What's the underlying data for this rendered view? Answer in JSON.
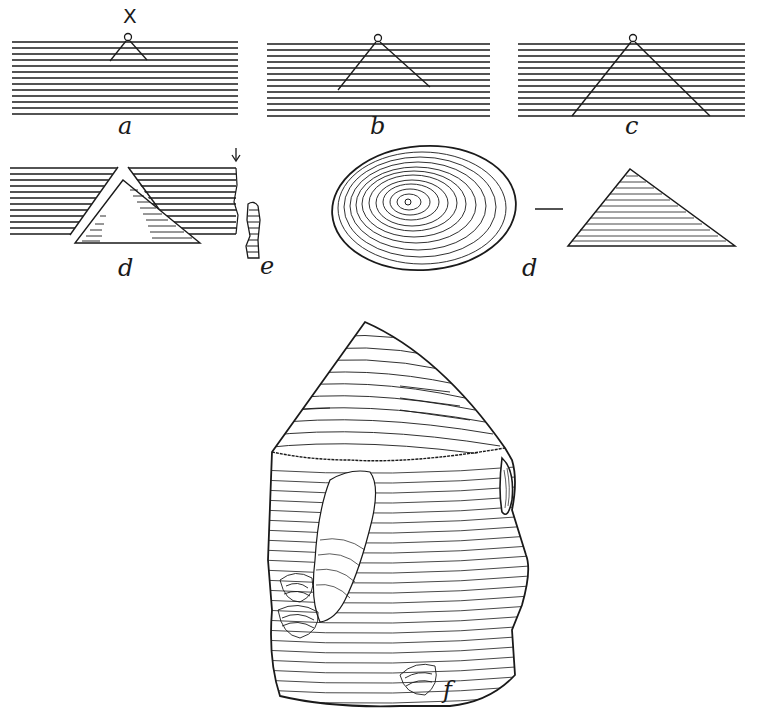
{
  "figure": {
    "ink_color": "#1a1a1a",
    "background": "#ffffff",
    "panels": [
      {
        "id": "a",
        "label": "a",
        "marker": "X",
        "cone_spread": "small"
      },
      {
        "id": "b",
        "label": "b",
        "cone_spread": "medium"
      },
      {
        "id": "c",
        "label": "c",
        "cone_spread": "full-depth"
      },
      {
        "id": "d-section",
        "label": "d",
        "content": "detached cone within split layers, arrow marking edge"
      },
      {
        "id": "e",
        "label": "e",
        "content": "edge profile of fractured layers"
      },
      {
        "id": "d-views",
        "label": "d",
        "content": "detached cone: top view (concentric rings) — side view (triangle)",
        "separator": "—"
      },
      {
        "id": "f",
        "label": "f",
        "content": "flint nodule showing bulb of percussion cone and flaking scars"
      }
    ]
  }
}
